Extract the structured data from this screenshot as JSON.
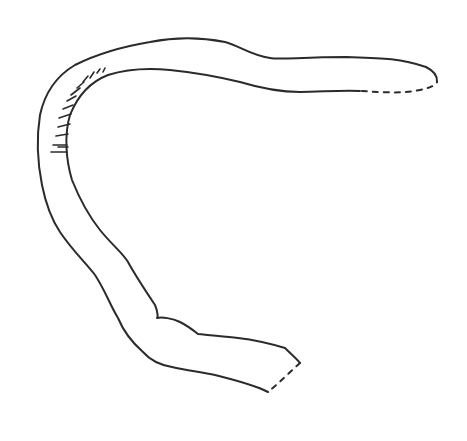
{
  "figure": {
    "background": "#ffffff",
    "stroke_color": "#2b2b2b"
  }
}
